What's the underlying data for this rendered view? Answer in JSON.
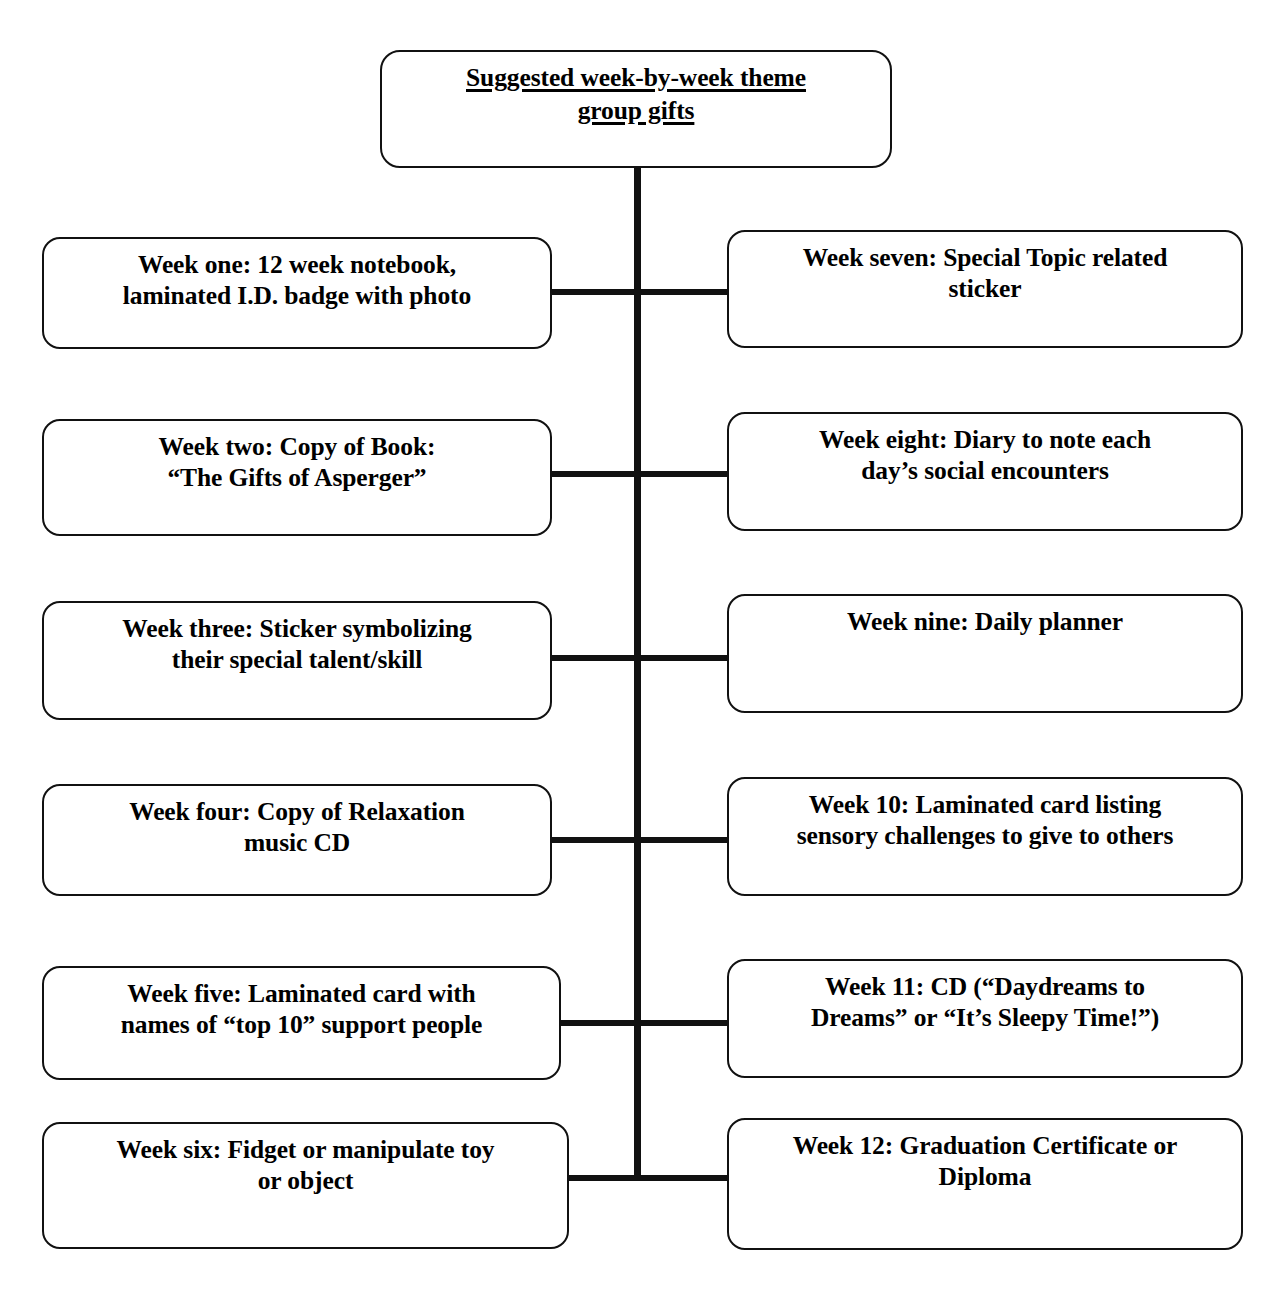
{
  "diagram": {
    "title_node": {
      "text": "Suggested week-by-week theme\ngroup gifts"
    },
    "left_column": [
      {
        "text": "Week one: 12 week notebook,\nlaminated I.D. badge with photo"
      },
      {
        "text": "Week two: Copy of Book:\n“The Gifts of Asperger”"
      },
      {
        "text": "Week three: Sticker symbolizing\ntheir special talent/skill"
      },
      {
        "text": "Week four: Copy of Relaxation\nmusic CD"
      },
      {
        "text": "Week five: Laminated card with\nnames of “top 10” support people"
      },
      {
        "text": "Week six: Fidget or manipulate toy\nor object"
      }
    ],
    "right_column": [
      {
        "text": "Week seven: Special Topic related\nsticker"
      },
      {
        "text": "Week eight: Diary to note each\nday’s social encounters"
      },
      {
        "text": "Week nine: Daily planner"
      },
      {
        "text": "Week 10: Laminated card listing\nsensory challenges to give to others"
      },
      {
        "text": "Week 11: CD (“Daydreams to\nDreams” or “It’s Sleepy Time!”)"
      },
      {
        "text": "Week 12: Graduation Certificate or\nDiploma"
      }
    ],
    "colors": {
      "line": "#111111",
      "box_border": "#111111",
      "background": "#ffffff",
      "text": "#000000"
    }
  }
}
